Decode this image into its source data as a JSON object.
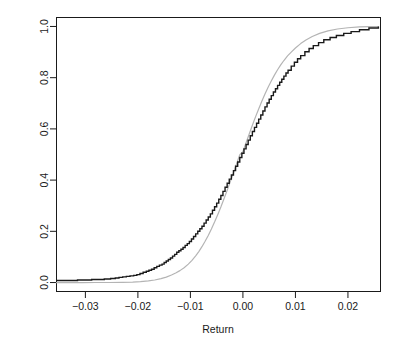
{
  "chart_data": {
    "type": "line",
    "title": "",
    "subtitle": "",
    "xlabel": "Return",
    "ylabel": "",
    "xlim": [
      -0.0355,
      0.0262
    ],
    "ylim": [
      -0.035,
      1.035
    ],
    "grid": false,
    "legend": null,
    "xticks": [
      -0.03,
      -0.02,
      -0.01,
      0.0,
      0.01,
      0.02
    ],
    "xtick_labels": [
      "-0.03",
      "-0.02",
      "-0.01",
      "0.00",
      "0.01",
      "0.02"
    ],
    "yticks": [
      0.0,
      0.2,
      0.4,
      0.6,
      0.8,
      1.0
    ],
    "ytick_labels": [
      "0.0",
      "0.2",
      "0.4",
      "0.6",
      "0.8",
      "1.0"
    ],
    "series": [
      {
        "name": "empirical-cdf",
        "style": "step",
        "color": "#1a1a1a",
        "width": 1.4,
        "x": [
          -0.0355,
          -0.033,
          -0.0315,
          -0.03,
          -0.0288,
          -0.0276,
          -0.0264,
          -0.0252,
          -0.0243,
          -0.0236,
          -0.0229,
          -0.0222,
          -0.0215,
          -0.0208,
          -0.0202,
          -0.0196,
          -0.019,
          -0.0184,
          -0.0179,
          -0.0174,
          -0.0169,
          -0.0164,
          -0.0159,
          -0.0154,
          -0.015,
          -0.0146,
          -0.0142,
          -0.0138,
          -0.0134,
          -0.013,
          -0.0126,
          -0.0122,
          -0.0118,
          -0.0114,
          -0.011,
          -0.0106,
          -0.0102,
          -0.0098,
          -0.0094,
          -0.009,
          -0.0086,
          -0.0082,
          -0.0078,
          -0.0074,
          -0.007,
          -0.0066,
          -0.0062,
          -0.0058,
          -0.0054,
          -0.005,
          -0.0046,
          -0.0042,
          -0.0038,
          -0.0034,
          -0.003,
          -0.0026,
          -0.0022,
          -0.0018,
          -0.0014,
          -0.001,
          -0.0006,
          -0.0002,
          0.0002,
          0.0006,
          0.001,
          0.0014,
          0.0018,
          0.0022,
          0.0026,
          0.003,
          0.0034,
          0.0038,
          0.0042,
          0.0046,
          0.005,
          0.0054,
          0.0058,
          0.0062,
          0.0066,
          0.007,
          0.0074,
          0.0078,
          0.0082,
          0.0086,
          0.0092,
          0.0098,
          0.0104,
          0.011,
          0.0118,
          0.0126,
          0.0134,
          0.0144,
          0.0154,
          0.0166,
          0.0178,
          0.0192,
          0.0206,
          0.0222,
          0.024,
          0.0258
        ],
        "y": [
          0.008,
          0.008,
          0.01,
          0.01,
          0.012,
          0.012,
          0.014,
          0.016,
          0.018,
          0.02,
          0.022,
          0.024,
          0.026,
          0.028,
          0.031,
          0.035,
          0.04,
          0.044,
          0.048,
          0.052,
          0.058,
          0.063,
          0.068,
          0.072,
          0.078,
          0.084,
          0.09,
          0.096,
          0.103,
          0.11,
          0.118,
          0.124,
          0.13,
          0.137,
          0.145,
          0.152,
          0.16,
          0.17,
          0.18,
          0.19,
          0.2,
          0.21,
          0.22,
          0.232,
          0.244,
          0.256,
          0.268,
          0.282,
          0.296,
          0.31,
          0.325,
          0.34,
          0.356,
          0.372,
          0.388,
          0.404,
          0.42,
          0.437,
          0.454,
          0.471,
          0.488,
          0.505,
          0.522,
          0.539,
          0.556,
          0.573,
          0.59,
          0.606,
          0.622,
          0.638,
          0.654,
          0.67,
          0.686,
          0.701,
          0.716,
          0.73,
          0.744,
          0.757,
          0.77,
          0.782,
          0.794,
          0.806,
          0.818,
          0.829,
          0.845,
          0.86,
          0.874,
          0.886,
          0.901,
          0.914,
          0.925,
          0.937,
          0.948,
          0.957,
          0.965,
          0.973,
          0.98,
          0.987,
          0.994,
          1.0
        ]
      },
      {
        "name": "theoretical-normal-cdf",
        "style": "smooth",
        "color": "#b4b4b4",
        "width": 1.2,
        "mean": 0.0002,
        "sd": 0.0072,
        "x": [
          -0.0355,
          -0.033,
          -0.0305,
          -0.028,
          -0.0255,
          -0.023,
          -0.021,
          -0.0195,
          -0.018,
          -0.0168,
          -0.0156,
          -0.0146,
          -0.0136,
          -0.0128,
          -0.012,
          -0.0112,
          -0.0104,
          -0.0097,
          -0.009,
          -0.0084,
          -0.0078,
          -0.0072,
          -0.0066,
          -0.006,
          -0.0054,
          -0.0048,
          -0.0042,
          -0.0036,
          -0.003,
          -0.0024,
          -0.0018,
          -0.0012,
          -0.0006,
          0.0,
          0.0006,
          0.0012,
          0.0018,
          0.0024,
          0.003,
          0.0036,
          0.0042,
          0.0048,
          0.0054,
          0.006,
          0.0066,
          0.0072,
          0.0078,
          0.0085,
          0.0092,
          0.01,
          0.011,
          0.012,
          0.0132,
          0.0146,
          0.0162,
          0.018,
          0.02,
          0.0222,
          0.024,
          0.0258
        ],
        "y": [
          0.0,
          0.0,
          0.0,
          0.0001,
          0.0002,
          0.0007,
          0.0018,
          0.0035,
          0.0064,
          0.01,
          0.0153,
          0.0213,
          0.0293,
          0.037,
          0.0465,
          0.058,
          0.072,
          0.0867,
          0.1042,
          0.121,
          0.14,
          0.161,
          0.184,
          0.209,
          0.236,
          0.265,
          0.295,
          0.327,
          0.36,
          0.394,
          0.429,
          0.464,
          0.499,
          0.511,
          0.546,
          0.58,
          0.614,
          0.647,
          0.678,
          0.708,
          0.736,
          0.763,
          0.787,
          0.81,
          0.831,
          0.85,
          0.867,
          0.885,
          0.9,
          0.916,
          0.933,
          0.947,
          0.961,
          0.973,
          0.983,
          0.99,
          0.995,
          0.998,
          0.999,
          0.9996
        ]
      }
    ]
  },
  "axes": {
    "x_title": "Return",
    "y_title": "",
    "x_tick_labels": [
      "-0.03",
      "-0.02",
      "-0.01",
      "0.00",
      "0.01",
      "0.02"
    ],
    "y_tick_labels": [
      "0.0",
      "0.2",
      "0.4",
      "0.6",
      "0.8",
      "1.0"
    ]
  },
  "colors": {
    "empirical": "#1a1a1a",
    "theoretical": "#b4b4b4",
    "axis": "#1a1a1a",
    "background": "#ffffff"
  }
}
